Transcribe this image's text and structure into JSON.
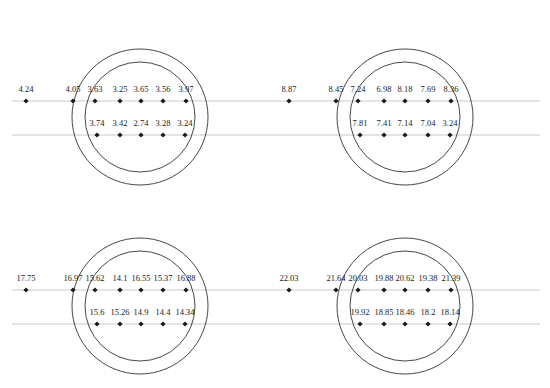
{
  "caption": "",
  "chart_data": {
    "type": "diagram",
    "panels": [
      {
        "id": "top-left",
        "row1": [
          "4.24",
          "4.05",
          "3.63",
          "3.25",
          "3.65",
          "3.56",
          "3.97"
        ],
        "row2": [
          "3.74",
          "3.42",
          "2.74",
          "3.28",
          "3.24"
        ]
      },
      {
        "id": "top-right",
        "row1": [
          "8.87",
          "8.45",
          "7.24",
          "6.98",
          "8.18",
          "7.69",
          "8.36"
        ],
        "row2": [
          "7.81",
          "7.41",
          "7.14",
          "7.04",
          "3.24"
        ]
      },
      {
        "id": "bottom-left",
        "row1": [
          "17.75",
          "16.97",
          "15.62",
          "14.1",
          "16.55",
          "15.37",
          "16.88"
        ],
        "row2": [
          "15.6",
          "15.26",
          "14.9",
          "14.4",
          "14.34"
        ]
      },
      {
        "id": "bottom-right",
        "row1": [
          "22.03",
          "21.64",
          "20.03",
          "19.88",
          "20.62",
          "19.38",
          "21.39"
        ],
        "row2": [
          "19.92",
          "18.85",
          "18.46",
          "18.2",
          "18.14"
        ]
      }
    ]
  }
}
